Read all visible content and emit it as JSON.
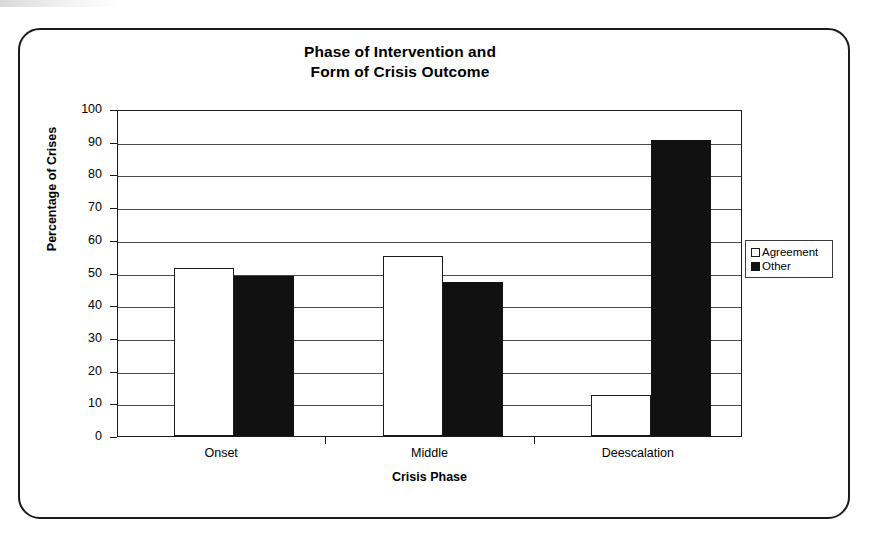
{
  "figure": {
    "title_line_1": "Phase of Intervention and",
    "title_line_2": "Form of Crisis Outcome"
  },
  "legend": {
    "position": "right",
    "items": [
      {
        "label": "Agreement",
        "swatch": "hollow-square-icon",
        "color": "#ffffff"
      },
      {
        "label": "Other",
        "swatch": "filled-square-icon",
        "color": "#111111"
      }
    ]
  },
  "axes": {
    "y_title": "Percentage of Crises",
    "x_title": "Crisis Phase",
    "y_ticks": [
      "100",
      "90",
      "80",
      "70",
      "60",
      "50",
      "40",
      "30",
      "20",
      "10",
      "0"
    ]
  },
  "chart_data": {
    "type": "bar",
    "title": "Phase of Intervention and Form of Crisis Outcome",
    "xlabel": "Crisis Phase",
    "ylabel": "Percentage of Crises",
    "ylim": [
      0,
      100
    ],
    "ytick_step": 10,
    "grid": true,
    "legend_position": "right",
    "categories": [
      "Onset",
      "Middle",
      "Deescalation"
    ],
    "series": [
      {
        "name": "Agreement",
        "color": "#ffffff",
        "values": [
          51.5,
          55,
          12.5
        ]
      },
      {
        "name": "Other",
        "color": "#111111",
        "values": [
          49,
          47,
          90.5
        ]
      }
    ]
  }
}
